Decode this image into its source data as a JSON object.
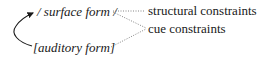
{
  "diagram": {
    "nodes": {
      "surface_form": "/ surface form /",
      "auditory_form": "[auditory form]",
      "structural_constraints": "structural constraints",
      "cue_constraints": "cue constraints"
    },
    "edges": [
      {
        "from": "auditory_form",
        "to": "surface_form",
        "style": "solid-curved-arrow"
      },
      {
        "from": "surface_form",
        "to": "structural_constraints",
        "style": "dotted"
      },
      {
        "from": "surface_form",
        "to": "cue_constraints",
        "style": "dotted"
      },
      {
        "from": "auditory_form",
        "to": "cue_constraints",
        "style": "dotted"
      }
    ],
    "colors": {
      "ink": "#1a1a1a",
      "dotted": "#777777"
    }
  }
}
